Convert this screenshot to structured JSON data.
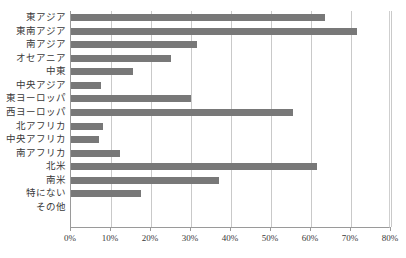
{
  "chart_data": {
    "type": "bar",
    "orientation": "horizontal",
    "title": "",
    "xlabel": "",
    "ylabel": "",
    "xlim": [
      0,
      80
    ],
    "xticks": [
      "0%",
      "10%",
      "20%",
      "30%",
      "40%",
      "50%",
      "60%",
      "70%",
      "80%"
    ],
    "xtick_values": [
      0,
      10,
      20,
      30,
      40,
      50,
      60,
      70,
      80
    ],
    "grid": true,
    "legend": false,
    "bar_color": "#787878",
    "categories": [
      "東アジア",
      "東南アジア",
      "南アジア",
      "オセアニア",
      "中東",
      "中央アジア",
      "東ヨーロッパ",
      "西ヨーロッパ",
      "北アフリカ",
      "中央アフリカ",
      "南アフリカ",
      "北米",
      "南米",
      "特にない",
      "その他"
    ],
    "values": [
      63.5,
      71.5,
      31.5,
      25.0,
      15.5,
      7.5,
      30.0,
      55.5,
      8.0,
      7.0,
      12.3,
      61.5,
      37.0,
      17.5,
      0.0
    ]
  },
  "axis": {
    "unit_suffix": "%"
  }
}
